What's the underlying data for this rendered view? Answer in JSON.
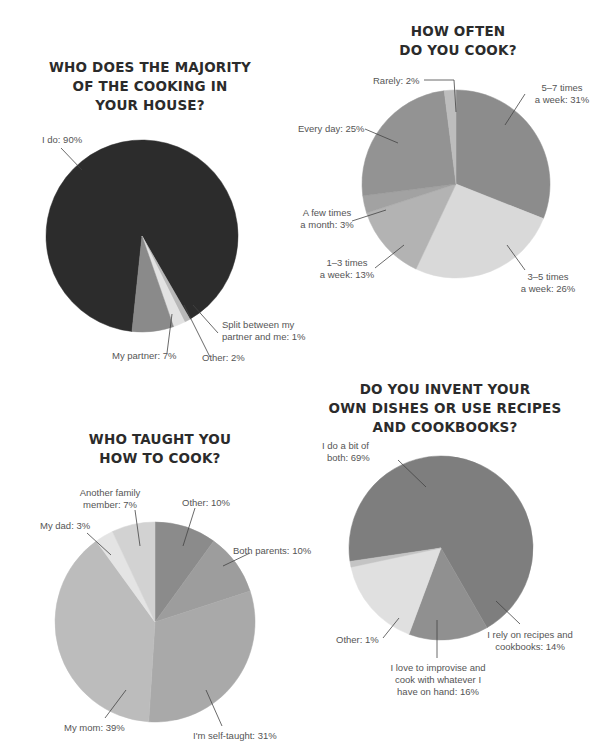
{
  "chart_data": [
    {
      "type": "pie",
      "title": "WHO DOES THE MAJORITY OF THE COOKING IN YOUR HOUSE?",
      "title_lines": [
        "WHO DOES THE MAJORITY",
        "OF THE COOKING IN",
        "YOUR HOUSE?"
      ],
      "slices": [
        {
          "label": "I do",
          "value": 90,
          "text": "I do: 90%",
          "color": "#2c2c2c"
        },
        {
          "label": "Split between my partner and me",
          "value": 1,
          "text_lines": [
            "Split between my",
            "partner and me: 1%"
          ],
          "color": "#b8b8b8"
        },
        {
          "label": "Other",
          "value": 2,
          "text": "Other: 2%",
          "color": "#e2e2e2"
        },
        {
          "label": "My partner",
          "value": 7,
          "text": "My partner: 7%",
          "color": "#8a8a8a"
        }
      ]
    },
    {
      "type": "pie",
      "title": "HOW OFTEN DO YOU COOK?",
      "title_lines": [
        "HOW OFTEN",
        "DO YOU COOK?"
      ],
      "slices": [
        {
          "label": "5-7 times a week",
          "value": 31,
          "text_lines": [
            "5–7 times",
            "a week: 31%"
          ],
          "color": "#8c8c8c"
        },
        {
          "label": "3-5 times a week",
          "value": 26,
          "text_lines": [
            "3–5 times",
            "a week: 26%"
          ],
          "color": "#d9d9d9"
        },
        {
          "label": "1-3 times a week",
          "value": 13,
          "text_lines": [
            "1–3 times",
            "a week: 13%"
          ],
          "color": "#b3b3b3"
        },
        {
          "label": "A few times a month",
          "value": 3,
          "text_lines": [
            "A few times",
            "a month: 3%"
          ],
          "color": "#a2a2a2"
        },
        {
          "label": "Every day",
          "value": 25,
          "text": "Every day: 25%",
          "color": "#939393"
        },
        {
          "label": "Rarely",
          "value": 2,
          "text": "Rarely: 2%",
          "color": "#bdbdbd"
        }
      ]
    },
    {
      "type": "pie",
      "title": "WHO TAUGHT YOU HOW TO COOK?",
      "title_lines": [
        "WHO TAUGHT YOU",
        "HOW TO COOK?"
      ],
      "slices": [
        {
          "label": "Other",
          "value": 10,
          "text": "Other: 10%",
          "color": "#8b8b8b"
        },
        {
          "label": "Both parents",
          "value": 10,
          "text": "Both parents: 10%",
          "color": "#9d9d9d"
        },
        {
          "label": "I'm self-taught",
          "value": 31,
          "text": "I'm self-taught: 31%",
          "color": "#a9a9a9"
        },
        {
          "label": "My mom",
          "value": 39,
          "text": "My mom: 39%",
          "color": "#bcbcbc"
        },
        {
          "label": "My dad",
          "value": 3,
          "text": "My dad: 3%",
          "color": "#e4e4e4"
        },
        {
          "label": "Another family member",
          "value": 7,
          "text_lines": [
            "Another family",
            "member: 7%"
          ],
          "color": "#d2d2d2"
        }
      ]
    },
    {
      "type": "pie",
      "title": "DO YOU INVENT YOUR OWN DISHES OR USE RECIPES AND COOKBOOKS?",
      "title_lines": [
        "DO YOU INVENT YOUR",
        "OWN DISHES OR USE RECIPES",
        "AND COOKBOOKS?"
      ],
      "slices": [
        {
          "label": "I do a bit of both",
          "value": 69,
          "text_lines": [
            "I do a bit of",
            "both: 69%"
          ],
          "color": "#7e7e7e"
        },
        {
          "label": "I rely on recipes and cookbooks",
          "value": 14,
          "text_lines": [
            "I rely on recipes and",
            "cookbooks: 14%"
          ],
          "color": "#909090"
        },
        {
          "label": "I love to improvise and cook with whatever I have on hand",
          "value": 16,
          "text_lines": [
            "I love to improvise and",
            "cook with whatever I",
            "have on hand: 16%"
          ],
          "color": "#e0e0e0"
        },
        {
          "label": "Other",
          "value": 1,
          "text": "Other: 1%",
          "color": "#c4c4c4"
        }
      ]
    }
  ]
}
